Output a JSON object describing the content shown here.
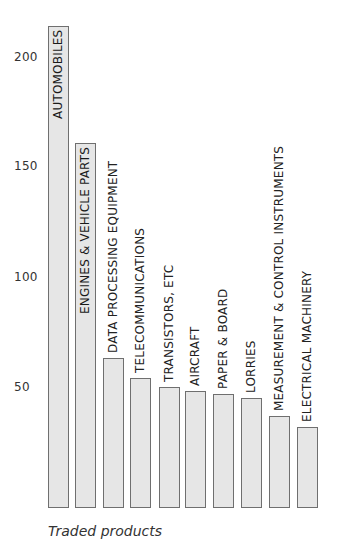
{
  "chart_data": {
    "type": "bar",
    "title": "",
    "xlabel": "Traded products",
    "ylabel": "",
    "ylim": [
      0,
      220
    ],
    "yticks": [
      50,
      100,
      150,
      200
    ],
    "grid": false,
    "legend": null,
    "categories": [
      "AUTOMOBILES",
      "ENGINES & VEHICLE PARTS",
      "DATA PROCESSING EQUIPMENT",
      "TELECOMMUNICATIONS",
      "TRANSISTORS, ETC",
      "AIRCRAFT",
      "PAPER & BOARD",
      "LORRIES",
      "MEASUREMENT & CONTROL INSTRUMENTS",
      "ELECTRICAL MACHINERY"
    ],
    "values": [
      214,
      161,
      63,
      54,
      50,
      48,
      47,
      45,
      37,
      32
    ],
    "bar_color": "#e6e6e6",
    "bar_border_color": "#6f6f6f"
  },
  "axis": {
    "ticks": [
      "200",
      "150",
      "100",
      "50"
    ]
  }
}
